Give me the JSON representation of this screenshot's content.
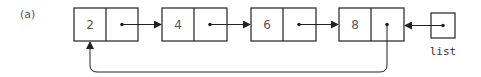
{
  "figure": {
    "label": "(a)",
    "nodes": [
      {
        "value": "2"
      },
      {
        "value": "4"
      },
      {
        "value": "6"
      },
      {
        "value": "8"
      }
    ],
    "pointer_label": "list"
  },
  "colors": {
    "stroke": "#222222",
    "text": "#555555"
  }
}
